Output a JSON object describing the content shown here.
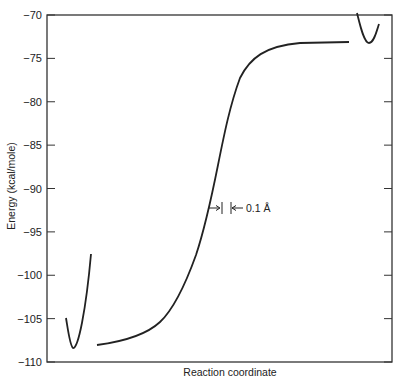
{
  "chart_data": {
    "type": "line",
    "title": "",
    "xlabel": "Reaction coordinate",
    "ylabel": "Energy (kcal/mole)",
    "ylim": [
      -110,
      -70
    ],
    "yticks": [
      -70,
      -75,
      -80,
      -85,
      -90,
      -95,
      -100,
      -105,
      -110
    ],
    "ytick_labels": [
      "−70",
      "−75",
      "−80",
      "−85",
      "−90",
      "−95",
      "−100",
      "−105",
      "−110"
    ],
    "grid": false,
    "annotations": [
      {
        "text": "0.1 Å",
        "description": "scale bar for reaction coordinate"
      }
    ],
    "series": [
      {
        "name": "left well",
        "points": [
          [
            0.05,
            -105.1
          ],
          [
            0.07,
            -108.5
          ],
          [
            0.12,
            -97.8
          ]
        ]
      },
      {
        "name": "main energy profile",
        "points": [
          [
            0.14,
            -108.1
          ],
          [
            0.2,
            -107.8
          ],
          [
            0.27,
            -107.1
          ],
          [
            0.33,
            -105.5
          ],
          [
            0.37,
            -103.6
          ],
          [
            0.4,
            -100.7
          ],
          [
            0.43,
            -97.8
          ],
          [
            0.45,
            -95.0
          ],
          [
            0.47,
            -92.4
          ],
          [
            0.49,
            -89.2
          ],
          [
            0.51,
            -85.7
          ],
          [
            0.52,
            -82.3
          ],
          [
            0.54,
            -79.4
          ],
          [
            0.56,
            -76.8
          ],
          [
            0.6,
            -74.9
          ],
          [
            0.65,
            -73.8
          ],
          [
            0.73,
            -73.4
          ],
          [
            0.87,
            -73.3
          ]
        ]
      },
      {
        "name": "right well",
        "points": [
          [
            0.9,
            -69.8
          ],
          [
            0.93,
            -73.2
          ],
          [
            0.96,
            -71.0
          ]
        ]
      }
    ]
  }
}
